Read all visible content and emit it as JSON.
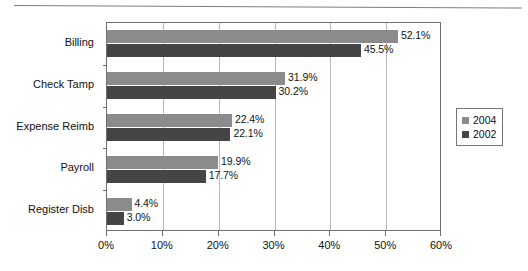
{
  "chart_data": {
    "type": "bar",
    "orientation": "horizontal",
    "title": "",
    "subtitle": "",
    "xlabel": "",
    "ylabel": "",
    "xlim": [
      0,
      60
    ],
    "xtick_values": [
      0,
      10,
      20,
      30,
      40,
      50,
      60
    ],
    "xtick_labels": [
      "0%",
      "10%",
      "20%",
      "30%",
      "40%",
      "50%",
      "60%"
    ],
    "grid": true,
    "grid_axis": "x",
    "legend_position": "right",
    "categories": [
      "Billing",
      "Check Tamp",
      "Expense Reimb",
      "Payroll",
      "Register Disb"
    ],
    "series": [
      {
        "name": "2004",
        "color": "#8b8b8b",
        "values": [
          52.1,
          31.9,
          22.4,
          19.9,
          4.4
        ],
        "labels": [
          "52.1%",
          "31.9%",
          "22.4%",
          "19.9%",
          "4.4%"
        ]
      },
      {
        "name": "2002",
        "color": "#454545",
        "values": [
          45.5,
          30.2,
          22.1,
          17.7,
          3.0
        ],
        "labels": [
          "45.5%",
          "30.2%",
          "22.1%",
          "17.7%",
          "3.0%"
        ]
      }
    ]
  },
  "legend": {
    "items": [
      {
        "label": "2004",
        "color": "#8b8b8b"
      },
      {
        "label": "2002",
        "color": "#454545"
      }
    ]
  },
  "colors": {
    "series_2004": "#8b8b8b",
    "series_2002": "#454545",
    "axis": "#6f6f6f",
    "gridline": "#b9b9b9",
    "text": "#101010",
    "background": "#ffffff"
  }
}
